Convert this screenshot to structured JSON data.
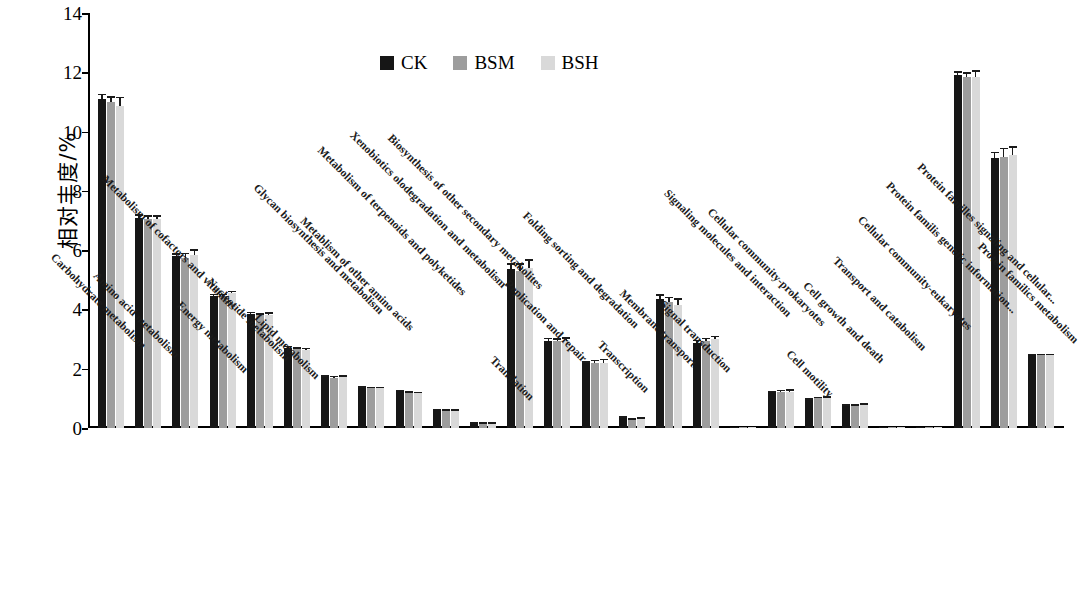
{
  "chart_data": {
    "type": "bar",
    "title": "",
    "subtitle": "",
    "xlabel": "",
    "ylabel": "相对丰度/%",
    "ylim": [
      0,
      14
    ],
    "yticks": [
      0,
      2,
      4,
      6,
      8,
      10,
      12,
      14
    ],
    "grid": false,
    "legend_position": "top-center",
    "orientation": "vertical",
    "categories": [
      "Carbohydrate metabolism",
      "Amino acid metabolism",
      "Metabolism of cofactors and vitamins",
      "Energy metabolism",
      "Nucleotide metabolism",
      "Lipid metabolism",
      "Glycan biosynthesis and metabolism",
      "Metablism of other amino acids",
      "Metabolism of terpenoids and polyketides",
      "Xenobiotics olodegradation and metabolism",
      "Biosynthesis of other secondary metabolites",
      "Translation",
      "Replication and repair",
      "Folding sorting and degradation",
      "Transcription",
      "Membrane transport",
      "Signal transduction",
      "Signaling molecules and interaction",
      "Cellular community-prokaryotes",
      "Cell motility",
      "Cell growth and death",
      "Transport and catabolism",
      "Cellular community-eukaryotes",
      "Protein familis genetic information...",
      "Protein familles signaling and cellular...",
      "Protein familics metabolism"
    ],
    "series": [
      {
        "name": "CK",
        "color": "#161616",
        "values": [
          11.1,
          7.1,
          5.8,
          4.45,
          3.85,
          2.7,
          1.72,
          1.36,
          1.24,
          0.6,
          0.16,
          5.35,
          2.95,
          2.18,
          0.34,
          4.35,
          2.88,
          0.05,
          1.2,
          0.95,
          0.75,
          0.04,
          0.05,
          11.9,
          9.1,
          2.45
        ],
        "errors": [
          0.18,
          0.12,
          0.1,
          0.08,
          0.08,
          0.08,
          0.06,
          0.05,
          0.05,
          0.05,
          0.03,
          0.22,
          0.1,
          0.08,
          0.05,
          0.16,
          0.1,
          0.02,
          0.06,
          0.05,
          0.05,
          0.01,
          0.01,
          0.14,
          0.22,
          0.06
        ]
      },
      {
        "name": "BSM",
        "color": "#9d9d9d",
        "values": [
          11.0,
          7.05,
          5.75,
          4.45,
          3.8,
          2.66,
          1.7,
          1.34,
          1.2,
          0.58,
          0.17,
          5.3,
          2.94,
          2.2,
          0.28,
          4.25,
          2.95,
          0.04,
          1.22,
          1.0,
          0.76,
          0.03,
          0.04,
          11.85,
          9.15,
          2.45
        ],
        "errors": [
          0.2,
          0.12,
          0.16,
          0.08,
          0.08,
          0.07,
          0.06,
          0.05,
          0.05,
          0.05,
          0.03,
          0.26,
          0.1,
          0.1,
          0.05,
          0.18,
          0.1,
          0.02,
          0.07,
          0.06,
          0.05,
          0.01,
          0.01,
          0.16,
          0.3,
          0.06
        ]
      },
      {
        "name": "BSH",
        "color": "#d9d9d9",
        "values": [
          10.88,
          7.05,
          5.82,
          4.55,
          3.8,
          2.64,
          1.72,
          1.34,
          1.18,
          0.58,
          0.17,
          5.4,
          2.95,
          2.2,
          0.3,
          4.15,
          3.0,
          0.04,
          1.22,
          1.0,
          0.78,
          0.03,
          0.04,
          11.85,
          9.2,
          2.45
        ],
        "errors": [
          0.3,
          0.12,
          0.22,
          0.08,
          0.1,
          0.07,
          0.06,
          0.05,
          0.05,
          0.05,
          0.03,
          0.3,
          0.12,
          0.14,
          0.07,
          0.22,
          0.12,
          0.02,
          0.08,
          0.08,
          0.05,
          0.01,
          0.01,
          0.22,
          0.3,
          0.06
        ]
      }
    ]
  },
  "legend": {
    "items": [
      {
        "label": "CK",
        "color": "#161616"
      },
      {
        "label": "BSM",
        "color": "#9d9d9d"
      },
      {
        "label": "BSH",
        "color": "#d9d9d9"
      }
    ]
  },
  "axis": {
    "y_title": "相对丰度/%",
    "y_tick_labels": [
      "14",
      "12",
      "10",
      "8",
      "6",
      "4",
      "2",
      "0"
    ]
  }
}
